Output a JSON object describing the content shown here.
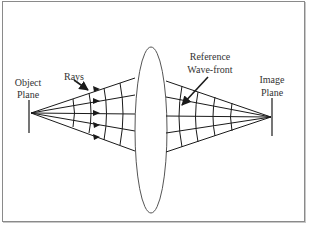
{
  "diagram": {
    "type": "optical lens ray diagram",
    "labels": {
      "object_plane_line1": "Object",
      "object_plane_line2": "Plane",
      "rays": "Rays",
      "reference_wavefront_line1": "Reference",
      "reference_wavefront_line2": "Wave-front",
      "image_plane_line1": "Image",
      "image_plane_line2": "Plane"
    },
    "colors": {
      "line": "#1a1a1a",
      "lens_outline": "#555555",
      "text": "#333333",
      "frame": "#8a8a8a"
    },
    "elements": [
      "object-plane",
      "converging-rays-left",
      "lens",
      "reference-wavefront-right",
      "image-plane"
    ]
  }
}
